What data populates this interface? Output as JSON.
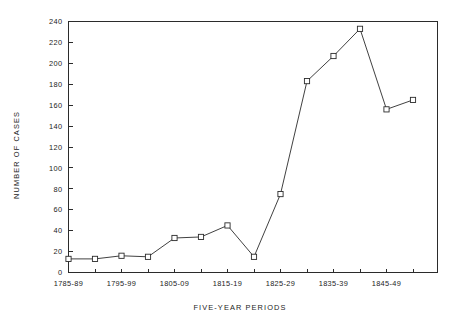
{
  "chart_data": {
    "type": "line",
    "title": "",
    "xlabel": "FIVE-YEAR PERIODS",
    "ylabel": "NUMBER OF CASES",
    "ylim": [
      0,
      240
    ],
    "ytick_values": [
      0,
      20,
      40,
      60,
      80,
      100,
      120,
      140,
      160,
      180,
      200,
      220,
      240
    ],
    "ytick_labels": [
      "0",
      "20",
      "40",
      "60",
      "80",
      "100",
      "120",
      "140",
      "160",
      "180",
      "200",
      "220",
      "240"
    ],
    "grid": false,
    "legend": "none",
    "marker": "open-square",
    "categories": [
      "1785-89",
      "1790-94",
      "1795-99",
      "1800-04",
      "1805-09",
      "1810-14",
      "1815-19",
      "1820-24",
      "1825-29",
      "1830-34",
      "1835-39",
      "1840-44",
      "1845-49",
      "1850-54"
    ],
    "xtick_labels_shown": [
      "1785-89",
      "",
      "1795-99",
      "",
      "1805-09",
      "",
      "1815-19",
      "",
      "1825-29",
      "",
      "1835-39",
      "",
      "1845-49",
      ""
    ],
    "values": [
      13,
      13,
      16,
      15,
      33,
      34,
      45,
      15,
      75,
      183,
      207,
      233,
      156,
      165
    ],
    "series": [
      {
        "name": "Number of cases",
        "values": [
          13,
          13,
          16,
          15,
          33,
          34,
          45,
          15,
          75,
          183,
          207,
          233,
          156,
          165
        ]
      }
    ]
  }
}
